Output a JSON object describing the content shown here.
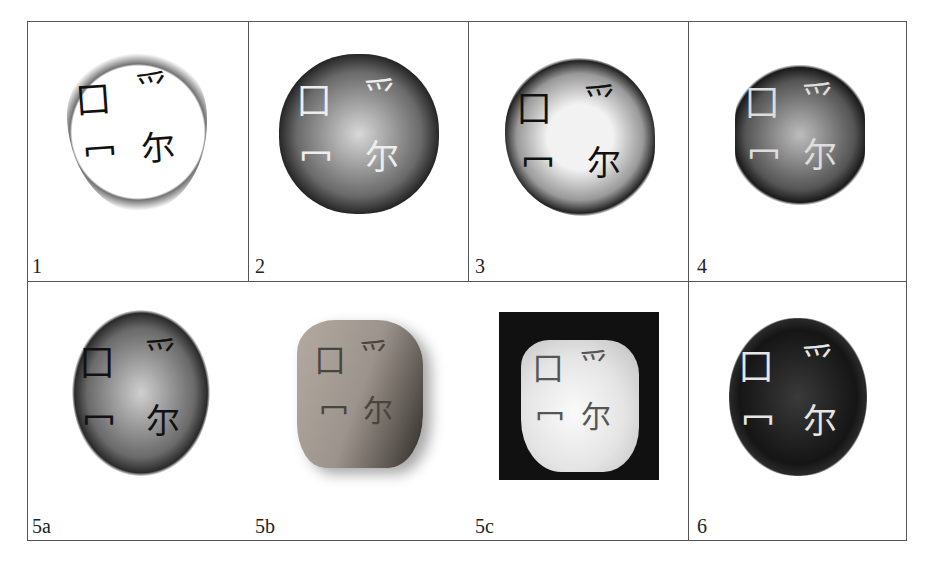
{
  "figure": {
    "panels": [
      {
        "id": "1",
        "label": "1",
        "style": "rubbing",
        "glyphs": [
          "囗",
          "爫",
          "冖",
          "尔"
        ]
      },
      {
        "id": "2",
        "label": "2",
        "style": "rubbing",
        "glyphs": [
          "囗",
          "爫",
          "冖",
          "尔"
        ]
      },
      {
        "id": "3",
        "label": "3",
        "style": "rubbing",
        "glyphs": [
          "囗",
          "爫",
          "冖",
          "尔"
        ]
      },
      {
        "id": "4",
        "label": "4",
        "style": "rubbing",
        "glyphs": [
          "囗",
          "爫",
          "冖",
          "尔"
        ]
      },
      {
        "id": "5a",
        "label": "5a",
        "style": "rubbing",
        "glyphs": [
          "囗",
          "爫",
          "冖",
          "尔"
        ]
      },
      {
        "id": "5b",
        "label": "5b",
        "style": "photo",
        "glyphs": [
          "囗",
          "爫",
          "冖",
          "尔"
        ]
      },
      {
        "id": "5c",
        "label": "5c",
        "style": "photo-dark",
        "glyphs": [
          "囗",
          "爫",
          "冖",
          "尔"
        ]
      },
      {
        "id": "6",
        "label": "6",
        "style": "rubbing-dense",
        "glyphs": [
          "囗",
          "爫",
          "冖",
          "尔"
        ]
      }
    ]
  }
}
